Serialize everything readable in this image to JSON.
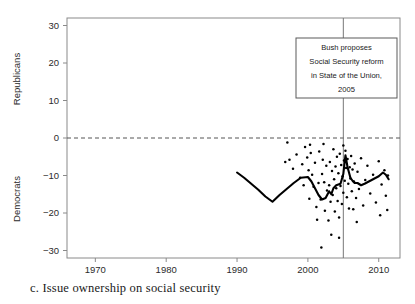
{
  "figure": {
    "caption": "c.  Issue ownership on social security",
    "panel_letter": "c."
  },
  "chart_data": {
    "type": "scatter",
    "title": "",
    "xlabel": "",
    "ylabel_top": "Republicans",
    "ylabel_bottom": "Democrats",
    "xlim": [
      1966,
      2013
    ],
    "ylim": [
      -32,
      32
    ],
    "xticks": [
      1970,
      1980,
      1990,
      2000,
      2010
    ],
    "xticklabels": [
      "1970",
      "1980",
      "1990",
      "2000",
      "2010"
    ],
    "yticks": [
      -30,
      -20,
      -10,
      0,
      10,
      20,
      30
    ],
    "yticklabels": [
      "−30",
      "−20",
      "−10",
      "0",
      "10",
      "20",
      "30"
    ],
    "grid": false,
    "zero_line": {
      "value": 0,
      "style": "dashed",
      "color": "#555555"
    },
    "event_line": {
      "value": 2005,
      "style": "solid",
      "color": "#777777"
    },
    "annotation": {
      "x": 2005,
      "lines": [
        "Bush proposes",
        "Social Security reform",
        "in State of the Union,",
        "2005"
      ]
    },
    "series": [
      {
        "name": "smoothed trend",
        "type": "line",
        "color": "#000000",
        "x": [
          1990.0,
          1991.0,
          1992.0,
          1993.0,
          1994.0,
          1995.0,
          1996.0,
          1997.0,
          1998.0,
          1999.0,
          2000.0,
          2000.5,
          2001.0,
          2001.5,
          2002.0,
          2002.5,
          2003.0,
          2003.3,
          2003.6,
          2004.0,
          2004.3,
          2004.6,
          2005.0,
          2005.3,
          2005.6,
          2006.0,
          2006.3,
          2006.6,
          2007.0,
          2007.5,
          2008.0,
          2009.0,
          2010.0,
          2010.6,
          2011.0,
          2011.4
        ],
        "y": [
          -9.2,
          -10.6,
          -12.2,
          -13.8,
          -15.6,
          -17.0,
          -15.2,
          -13.6,
          -12.0,
          -10.6,
          -10.4,
          -11.6,
          -13.4,
          -15.2,
          -16.4,
          -16.0,
          -14.2,
          -15.0,
          -13.4,
          -12.6,
          -12.4,
          -12.2,
          -9.6,
          -4.6,
          -7.8,
          -10.6,
          -11.4,
          -12.0,
          -12.0,
          -12.6,
          -12.2,
          -11.2,
          -10.2,
          -9.2,
          -9.8,
          -11.0
        ]
      },
      {
        "name": "observations",
        "type": "scatter",
        "color": "#000000",
        "points": [
          [
            1996.8,
            -6.4
          ],
          [
            1997.1,
            -1.2
          ],
          [
            1997.4,
            -5.8
          ],
          [
            1997.9,
            -8.2
          ],
          [
            1998.4,
            -4.4
          ],
          [
            1998.9,
            -10.6
          ],
          [
            1999.2,
            -7.0
          ],
          [
            1999.6,
            -2.4
          ],
          [
            1999.9,
            -5.2
          ],
          [
            2000.1,
            -8.6
          ],
          [
            2000.3,
            -1.8
          ],
          [
            2000.4,
            -4.0
          ],
          [
            2000.6,
            -9.8
          ],
          [
            2000.8,
            -13.0
          ],
          [
            2001.0,
            -6.6
          ],
          [
            2001.2,
            -18.4
          ],
          [
            2001.3,
            -21.8
          ],
          [
            2001.5,
            -12.0
          ],
          [
            2001.6,
            -3.6
          ],
          [
            2001.8,
            -16.4
          ],
          [
            2002.0,
            -9.6
          ],
          [
            2002.1,
            -5.8
          ],
          [
            2002.3,
            -11.8
          ],
          [
            2002.4,
            -19.4
          ],
          [
            2002.6,
            -7.4
          ],
          [
            2002.7,
            -14.0
          ],
          [
            2002.9,
            -22.0
          ],
          [
            2003.0,
            -12.6
          ],
          [
            2003.1,
            -6.4
          ],
          [
            2003.2,
            -17.0
          ],
          [
            2003.3,
            -25.8
          ],
          [
            2003.4,
            -8.8
          ],
          [
            2003.5,
            -15.2
          ],
          [
            2003.6,
            -3.0
          ],
          [
            2003.7,
            -11.0
          ],
          [
            2003.8,
            -19.6
          ],
          [
            2003.9,
            -7.6
          ],
          [
            2004.0,
            -13.4
          ],
          [
            2004.1,
            -5.0
          ],
          [
            2004.2,
            -16.8
          ],
          [
            2004.3,
            -9.4
          ],
          [
            2004.4,
            -21.2
          ],
          [
            2004.5,
            -4.2
          ],
          [
            2004.6,
            -12.8
          ],
          [
            2004.7,
            -7.2
          ],
          [
            2004.8,
            -17.6
          ],
          [
            2004.9,
            -10.2
          ],
          [
            2005.0,
            -2.0
          ],
          [
            2005.0,
            -14.6
          ],
          [
            2005.1,
            -6.0
          ],
          [
            2005.2,
            -11.4
          ],
          [
            2005.3,
            -3.4
          ],
          [
            2005.4,
            -8.0
          ],
          [
            2005.5,
            -15.8
          ],
          [
            2005.6,
            -5.6
          ],
          [
            2005.7,
            -12.2
          ],
          [
            2005.8,
            -18.8
          ],
          [
            2005.9,
            -7.8
          ],
          [
            2006.0,
            -10.8
          ],
          [
            2006.1,
            -4.8
          ],
          [
            2006.2,
            -14.2
          ],
          [
            2006.3,
            -8.4
          ],
          [
            2006.4,
            -19.0
          ],
          [
            2006.5,
            -11.6
          ],
          [
            2006.6,
            -6.8
          ],
          [
            2006.8,
            -16.0
          ],
          [
            2007.0,
            -9.0
          ],
          [
            2007.2,
            -13.6
          ],
          [
            2007.5,
            -5.4
          ],
          [
            2007.8,
            -18.0
          ],
          [
            2008.1,
            -11.2
          ],
          [
            2008.4,
            -7.4
          ],
          [
            2008.8,
            -14.8
          ],
          [
            2009.2,
            -9.8
          ],
          [
            2009.6,
            -17.2
          ],
          [
            2010.0,
            -6.2
          ],
          [
            2010.4,
            -12.4
          ],
          [
            2010.8,
            -8.6
          ],
          [
            2011.0,
            -15.4
          ],
          [
            2011.3,
            -10.0
          ],
          [
            2000.2,
            -16.2
          ],
          [
            1999.4,
            -12.6
          ],
          [
            2001.9,
            -29.2
          ],
          [
            2004.4,
            -26.6
          ],
          [
            2006.9,
            -22.4
          ],
          [
            2010.2,
            -20.6
          ],
          [
            2011.2,
            -19.2
          ],
          [
            2002.2,
            -1.6
          ]
        ]
      }
    ]
  }
}
